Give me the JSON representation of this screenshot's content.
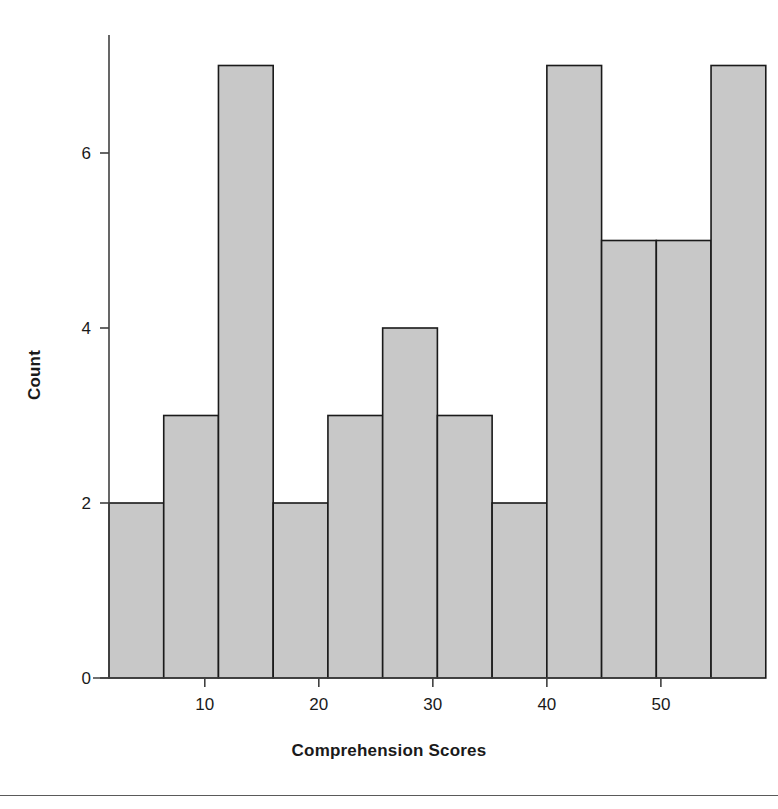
{
  "figure": {
    "background_color": "#ffffff",
    "width": 778,
    "height": 809
  },
  "axes": {
    "x_title": "Comprehension Scores",
    "y_title": "Count",
    "x_ticks": [
      "10",
      "20",
      "30",
      "40",
      "50"
    ],
    "y_ticks": [
      "0",
      "2",
      "4",
      "6"
    ],
    "axis_color": "#404040"
  },
  "bars": {
    "fill_color": "#c8c8c8",
    "edge_color": "#1a1a1a"
  },
  "footer": {
    "rule_color": "#5a5a5a"
  },
  "chart_data": {
    "type": "bar",
    "title": "",
    "subtitle": "",
    "xlabel": "Comprehension Scores",
    "ylabel": "Count",
    "xlim": [
      1.6,
      56.5
    ],
    "ylim": [
      0,
      7
    ],
    "xticks": [
      10,
      20,
      30,
      40,
      50
    ],
    "yticks": [
      0,
      2,
      4,
      6
    ],
    "grid": false,
    "legend": null,
    "bin_edges": [
      1.6,
      6.4,
      11.2,
      16.0,
      20.8,
      25.6,
      30.4,
      35.2,
      40.0,
      44.8,
      49.6,
      54.4,
      59.2
    ],
    "bin_centers": [
      4.0,
      8.8,
      13.6,
      18.4,
      23.2,
      28.0,
      32.8,
      37.6,
      42.4,
      47.2,
      52.0,
      56.8
    ],
    "categories": [
      "1.6-6.4",
      "6.4-11.2",
      "11.2-16.0",
      "16.0-20.8",
      "20.8-25.6",
      "25.6-30.4",
      "30.4-35.2",
      "35.2-40.0",
      "40.0-44.8",
      "44.8-49.6",
      "49.6-54.4",
      "54.4-59.2"
    ],
    "values": [
      2,
      3,
      7,
      2,
      3,
      4,
      3,
      2,
      7,
      5,
      5,
      7
    ],
    "total_count": 46,
    "annotations": []
  }
}
